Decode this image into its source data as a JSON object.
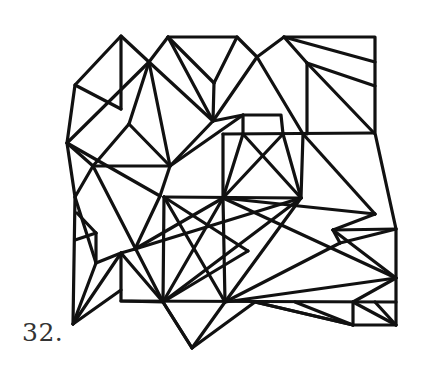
{
  "problem": {
    "number_label": "32."
  },
  "figure": {
    "stroke_color": "#111111",
    "background_color": "#ffffff"
  }
}
